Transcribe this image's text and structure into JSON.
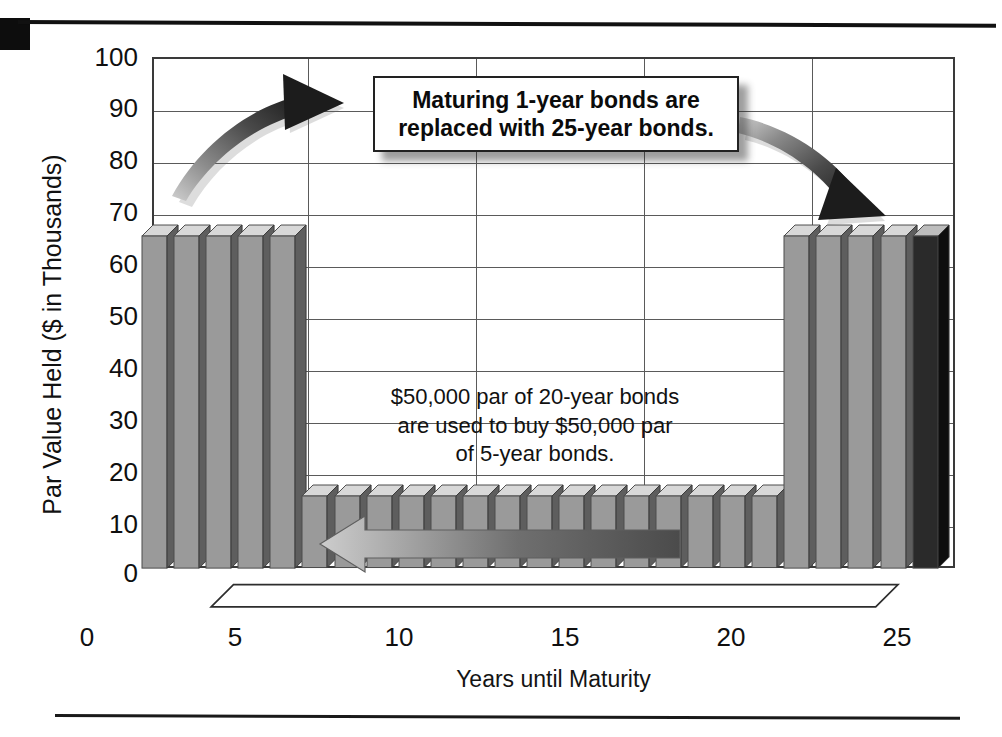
{
  "chart_data": {
    "type": "bar",
    "title": "",
    "xlabel": "Years until Maturity",
    "ylabel": "Par Value Held ($ in Thousands)",
    "xlim": [
      0,
      25
    ],
    "ylim": [
      0,
      100
    ],
    "ytick_labels": [
      "100",
      "90",
      "80",
      "70",
      "60",
      "50",
      "40",
      "30",
      "20",
      "10",
      "0"
    ],
    "ytick_values": [
      100,
      90,
      80,
      70,
      60,
      50,
      40,
      30,
      20,
      10,
      0
    ],
    "xtick_labels": [
      "0",
      "5",
      "10",
      "15",
      "20",
      "25"
    ],
    "xtick_values": [
      0,
      5,
      10,
      15,
      20,
      25
    ],
    "grid": true,
    "legend": "none",
    "series_name": "Par Value Held",
    "categories": [
      1,
      2,
      3,
      4,
      5,
      6,
      7,
      8,
      9,
      10,
      11,
      12,
      13,
      14,
      15,
      16,
      17,
      18,
      19,
      20,
      21,
      22,
      23,
      24,
      25
    ],
    "values": [
      65,
      65,
      65,
      65,
      65,
      14,
      14,
      14,
      14,
      14,
      14,
      14,
      14,
      14,
      14,
      14,
      14,
      14,
      14,
      14,
      65,
      65,
      65,
      65,
      65
    ],
    "highlighted_index": 24
  },
  "annotations": {
    "callout": {
      "line1": "Maturing 1-year bonds are",
      "line2": "replaced with 25-year bonds."
    },
    "middle_note": {
      "line1": "$50,000 par of 20-year bonds",
      "line2": "are used to buy $50,000 par",
      "line3": "of 5-year bonds."
    },
    "arrows": [
      {
        "name": "left-curved-arrow",
        "direction": "up-right",
        "meaning": "maturing short bonds move to long end"
      },
      {
        "name": "right-curved-arrow",
        "direction": "down-right",
        "meaning": "reinvested into 25-year bonds"
      },
      {
        "name": "horizontal-left-arrow",
        "direction": "left",
        "meaning": "20-year bonds roll down to 5-year bonds"
      }
    ]
  },
  "colors": {
    "bar_front": "#9a9a9a",
    "bar_side": "#5e5e5e",
    "bar_top": "#d8d8d8",
    "bar_highlight": "#2a2a2a",
    "grid": "#5a5a5a",
    "frame": "#3a3a3a",
    "text": "#111111",
    "rule": "#111111"
  }
}
